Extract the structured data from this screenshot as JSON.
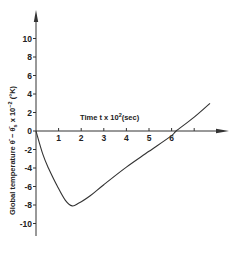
{
  "chart_data": {
    "type": "line",
    "title": "",
    "xlabel": "Time t x 10^2(sec)",
    "ylabel": "Global temperature θ̄ - θ̄s x 10^-2 (°K)",
    "x_ticks": [
      1,
      2,
      3,
      4,
      5,
      6,
      7
    ],
    "x_tick_labels": [
      "1",
      "2",
      "3",
      "4",
      "5",
      "6",
      ""
    ],
    "y_ticks": [
      10,
      8,
      6,
      4,
      2,
      0,
      -2,
      -4,
      -6,
      -8,
      -10
    ],
    "y_tick_labels": [
      "10",
      "8",
      "6",
      "4",
      "2",
      "0",
      "-2",
      "-4",
      "-6",
      "-8",
      "-10"
    ],
    "xlim": [
      0,
      8.4
    ],
    "ylim": [
      -12,
      13
    ],
    "grid": false,
    "legend": null,
    "series": [
      {
        "name": "Global temperature",
        "x": [
          0,
          0.3,
          0.55,
          0.95,
          1.3,
          1.6,
          1.9,
          2.4,
          3.0,
          4.0,
          5.0,
          6.0,
          6.2,
          7.0,
          7.7
        ],
        "y": [
          0,
          -2.5,
          -4.0,
          -6.0,
          -7.5,
          -8.1,
          -7.8,
          -7.0,
          -5.8,
          -3.9,
          -2.2,
          -0.5,
          0,
          1.5,
          3.0
        ]
      }
    ]
  },
  "labels": {
    "x_axis_title": "Time t x 10",
    "x_axis_exp": "2",
    "x_axis_unit": "(sec)",
    "y_axis_title": "Global temperature θ̄ − θ̄",
    "y_axis_sub": "s",
    "y_axis_rest": " x 10",
    "y_axis_exp": "−2",
    "y_axis_unit": " (°K)"
  },
  "style": {
    "line_color": "#333333",
    "axis_color": "#333333"
  }
}
